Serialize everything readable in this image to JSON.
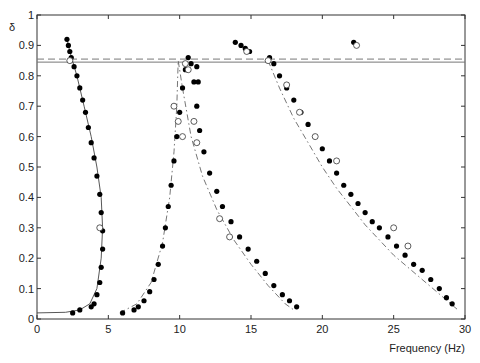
{
  "chart_data": {
    "type": "scatter",
    "title": "",
    "xlabel": "Frequency (Hz)",
    "ylabel": "δ",
    "xlim": [
      0,
      30
    ],
    "ylim": [
      0,
      1
    ],
    "xticks": [
      0,
      5,
      10,
      15,
      20,
      25,
      30
    ],
    "yticks": [
      0,
      0.1,
      0.2,
      0.3,
      0.4,
      0.5,
      0.6,
      0.7,
      0.8,
      0.9,
      1
    ],
    "ytick_labels": [
      "0",
      "0.1",
      "0.2",
      "0.3",
      "0.4",
      "0.5",
      "0.6",
      "0.7",
      "0.8",
      "0.9",
      "1"
    ],
    "grid": false,
    "reference_lines": [
      {
        "style": "solid",
        "y": 0.845
      },
      {
        "style": "dashed",
        "y": 0.855
      }
    ],
    "series": [
      {
        "name": "branch-1-filled",
        "marker": "filled-circle",
        "points": [
          [
            2.1,
            0.92
          ],
          [
            2.2,
            0.9
          ],
          [
            2.3,
            0.88
          ],
          [
            2.4,
            0.86
          ],
          [
            2.6,
            0.83
          ],
          [
            2.8,
            0.8
          ],
          [
            3.0,
            0.76
          ],
          [
            3.2,
            0.72
          ],
          [
            3.4,
            0.68
          ],
          [
            3.6,
            0.63
          ],
          [
            3.8,
            0.58
          ],
          [
            4.0,
            0.53
          ],
          [
            4.2,
            0.47
          ],
          [
            4.4,
            0.41
          ],
          [
            4.5,
            0.35
          ],
          [
            4.6,
            0.29
          ],
          [
            4.6,
            0.23
          ],
          [
            4.5,
            0.17
          ],
          [
            4.4,
            0.12
          ],
          [
            4.2,
            0.08
          ],
          [
            4.0,
            0.05
          ],
          [
            3.8,
            0.04
          ],
          [
            3.0,
            0.03
          ],
          [
            2.5,
            0.02
          ]
        ]
      },
      {
        "name": "branch-2-filled",
        "marker": "filled-circle",
        "points": [
          [
            6.0,
            0.02
          ],
          [
            6.8,
            0.03
          ],
          [
            7.1,
            0.04
          ],
          [
            7.5,
            0.06
          ],
          [
            7.9,
            0.09
          ],
          [
            8.2,
            0.13
          ],
          [
            8.5,
            0.18
          ],
          [
            8.8,
            0.24
          ],
          [
            9.0,
            0.3
          ],
          [
            9.2,
            0.37
          ],
          [
            9.4,
            0.44
          ],
          [
            9.6,
            0.52
          ],
          [
            9.8,
            0.6
          ],
          [
            10.0,
            0.68
          ],
          [
            10.2,
            0.76
          ],
          [
            10.4,
            0.82
          ],
          [
            10.6,
            0.86
          ],
          [
            10.8,
            0.84
          ],
          [
            11.0,
            0.78
          ],
          [
            11.2,
            0.7
          ],
          [
            11.4,
            0.62
          ],
          [
            11.7,
            0.55
          ],
          [
            12.1,
            0.48
          ],
          [
            12.6,
            0.42
          ],
          [
            13.0,
            0.37
          ],
          [
            13.6,
            0.32
          ],
          [
            14.2,
            0.27
          ],
          [
            14.8,
            0.23
          ],
          [
            15.4,
            0.19
          ],
          [
            16.0,
            0.15
          ],
          [
            16.6,
            0.11
          ],
          [
            17.2,
            0.08
          ],
          [
            17.7,
            0.06
          ],
          [
            18.2,
            0.04
          ],
          [
            11.2,
            0.83
          ],
          [
            11.3,
            0.78
          ]
        ]
      },
      {
        "name": "branch-3-filled",
        "marker": "filled-circle",
        "points": [
          [
            13.9,
            0.91
          ],
          [
            14.3,
            0.9
          ],
          [
            14.6,
            0.89
          ],
          [
            14.9,
            0.88
          ],
          [
            16.3,
            0.86
          ],
          [
            16.6,
            0.84
          ],
          [
            17.0,
            0.8
          ],
          [
            17.5,
            0.76
          ],
          [
            18.0,
            0.72
          ],
          [
            18.5,
            0.68
          ],
          [
            19.0,
            0.64
          ],
          [
            19.5,
            0.6
          ],
          [
            20.0,
            0.56
          ],
          [
            20.5,
            0.52
          ],
          [
            21.0,
            0.48
          ],
          [
            21.5,
            0.44
          ],
          [
            22.0,
            0.41
          ],
          [
            22.5,
            0.38
          ],
          [
            23.0,
            0.35
          ],
          [
            23.5,
            0.32
          ],
          [
            24.0,
            0.3
          ],
          [
            24.6,
            0.27
          ],
          [
            25.2,
            0.24
          ],
          [
            25.8,
            0.21
          ],
          [
            26.4,
            0.18
          ],
          [
            27.0,
            0.16
          ],
          [
            27.6,
            0.13
          ],
          [
            28.2,
            0.1
          ],
          [
            28.7,
            0.07
          ],
          [
            29.1,
            0.05
          ],
          [
            22.2,
            0.91
          ]
        ]
      },
      {
        "name": "open-circles",
        "marker": "open-circle",
        "points": [
          [
            2.3,
            0.85
          ],
          [
            4.4,
            0.3
          ],
          [
            9.6,
            0.7
          ],
          [
            9.9,
            0.65
          ],
          [
            10.2,
            0.6
          ],
          [
            10.4,
            0.84
          ],
          [
            10.6,
            0.82
          ],
          [
            11.0,
            0.65
          ],
          [
            11.2,
            0.58
          ],
          [
            12.8,
            0.33
          ],
          [
            13.5,
            0.27
          ],
          [
            14.7,
            0.88
          ],
          [
            16.2,
            0.85
          ],
          [
            17.5,
            0.77
          ],
          [
            18.4,
            0.68
          ],
          [
            19.5,
            0.6
          ],
          [
            21.0,
            0.52
          ],
          [
            22.4,
            0.9
          ],
          [
            25.0,
            0.3
          ],
          [
            26.0,
            0.24
          ]
        ]
      },
      {
        "name": "solid-curve",
        "style": "solid",
        "points": [
          [
            0,
            0.02
          ],
          [
            2,
            0.022
          ],
          [
            3,
            0.03
          ],
          [
            3.7,
            0.05
          ],
          [
            4.2,
            0.1
          ],
          [
            4.5,
            0.2
          ],
          [
            4.6,
            0.3
          ],
          [
            4.5,
            0.4
          ],
          [
            4.2,
            0.5
          ],
          [
            3.8,
            0.6
          ],
          [
            3.3,
            0.7
          ],
          [
            2.8,
            0.8
          ],
          [
            2.3,
            0.88
          ],
          [
            2.1,
            0.92
          ]
        ]
      },
      {
        "name": "dash-dot-curve-1",
        "style": "dash-dot",
        "points": [
          [
            5.8,
            0.02
          ],
          [
            7,
            0.05
          ],
          [
            8,
            0.12
          ],
          [
            8.8,
            0.25
          ],
          [
            9.3,
            0.4
          ],
          [
            9.6,
            0.55
          ],
          [
            9.8,
            0.7
          ],
          [
            9.9,
            0.85
          ],
          [
            10.2,
            0.76
          ],
          [
            10.8,
            0.6
          ],
          [
            11.6,
            0.47
          ],
          [
            12.6,
            0.36
          ],
          [
            13.8,
            0.26
          ],
          [
            15,
            0.18
          ],
          [
            16.2,
            0.11
          ],
          [
            17.4,
            0.05
          ],
          [
            18,
            0.03
          ]
        ]
      },
      {
        "name": "dash-dot-curve-2",
        "style": "dash-dot",
        "points": [
          [
            16.2,
            0.85
          ],
          [
            17,
            0.76
          ],
          [
            18,
            0.66
          ],
          [
            19,
            0.58
          ],
          [
            20,
            0.5
          ],
          [
            21,
            0.43
          ],
          [
            22,
            0.37
          ],
          [
            23,
            0.31
          ],
          [
            24,
            0.26
          ],
          [
            25,
            0.21
          ],
          [
            26,
            0.17
          ],
          [
            27,
            0.13
          ],
          [
            28,
            0.09
          ],
          [
            29,
            0.05
          ],
          [
            29.5,
            0.03
          ]
        ]
      }
    ]
  }
}
